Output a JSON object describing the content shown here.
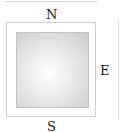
{
  "diagram": {
    "labels": {
      "north": "N",
      "east": "E",
      "south": "S"
    },
    "colors": {
      "frame_border": "#cfcfcf",
      "inner_center": "#ffffff",
      "inner_edge": "#cbcbcb",
      "label": "#222222"
    }
  }
}
